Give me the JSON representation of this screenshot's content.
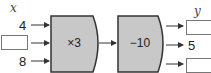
{
  "input": {
    "label": "x",
    "values": [
      "4",
      "",
      "8"
    ]
  },
  "machines": [
    {
      "operation": "×3",
      "fill": "#c8c8c8"
    },
    {
      "operation": "−10",
      "fill": "#c8c8c8"
    }
  ],
  "output": {
    "label": "y",
    "values": [
      "",
      "5",
      ""
    ]
  }
}
